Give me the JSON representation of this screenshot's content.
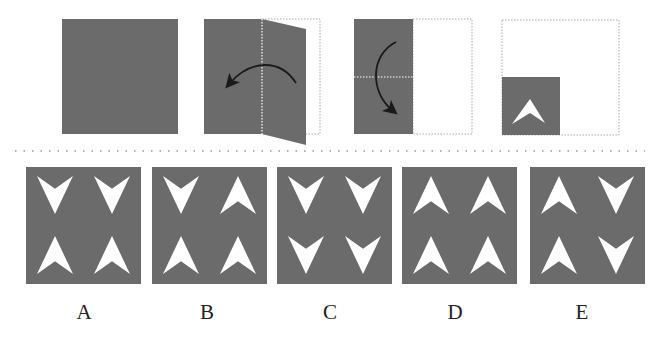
{
  "colors": {
    "paper": "#6b6b6b",
    "arrow_shape": "#ffffff",
    "outline": "#aaaaaa",
    "curve_arrow": "#1a1a1a",
    "label": "#222222",
    "background": "#ffffff"
  },
  "steps": [
    {
      "id": "step-1",
      "description": "unfolded square paper"
    },
    {
      "id": "step-2",
      "description": "fold right half over left along vertical dotted line",
      "icon": "curved-arrow-left"
    },
    {
      "id": "step-3",
      "description": "fold top half down along horizontal dotted line",
      "icon": "curved-arrow-down"
    },
    {
      "id": "step-4",
      "description": "folded quarter with arrowhead cut-out pointing up",
      "icon": "arrowhead-up"
    }
  ],
  "options": [
    {
      "label": "A",
      "cells": [
        "down",
        "down",
        "up",
        "up"
      ]
    },
    {
      "label": "B",
      "cells": [
        "down",
        "up",
        "up",
        "up"
      ]
    },
    {
      "label": "C",
      "cells": [
        "down",
        "down",
        "down",
        "down"
      ]
    },
    {
      "label": "D",
      "cells": [
        "up",
        "up",
        "up",
        "up"
      ]
    },
    {
      "label": "E",
      "cells": [
        "up",
        "down",
        "up",
        "down"
      ]
    }
  ]
}
